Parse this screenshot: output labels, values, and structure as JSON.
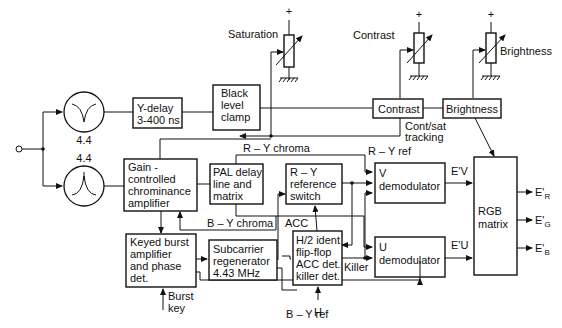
{
  "filters": {
    "notch": {
      "label": "4.4",
      "icon": "notch-filter-icon"
    },
    "bandpass": {
      "label": "4.4",
      "icon": "bandpass-filter-icon"
    }
  },
  "blocks": {
    "y_delay": [
      "Y-delay",
      "3-400 ns"
    ],
    "black_clamp": [
      "Black",
      "level",
      "clamp"
    ],
    "contrast": [
      "Contrast"
    ],
    "brightness": [
      "Brightness"
    ],
    "gain_amp": [
      "Gain -",
      "controlled",
      "chrominance",
      "amplifier"
    ],
    "pal_delay": [
      "PAL delay",
      "line and",
      "matrix"
    ],
    "ry_switch": [
      "R – Y",
      "reference",
      "switch"
    ],
    "v_demod": [
      "V",
      "demodulator"
    ],
    "u_demod": [
      "U",
      "demodulator"
    ],
    "rgb_matrix": [
      "RGB",
      "matrix"
    ],
    "keyed_burst": [
      "Keyed burst",
      "amplifier",
      "and phase",
      "det."
    ],
    "subcarrier": [
      "Subcarrier",
      "regenerator",
      "4.43 MHz"
    ],
    "h2_ident": [
      "H/2 ident",
      "flip-flop",
      "ACC det.",
      "killer det."
    ]
  },
  "controls": {
    "saturation": {
      "label": "Saturation",
      "supply": "+"
    },
    "contrast": {
      "label": "Contrast",
      "supply": "+"
    },
    "brightness": {
      "label": "Brightness",
      "supply": "+"
    }
  },
  "signals": {
    "cont_sat": [
      "Cont/sat",
      "tracking"
    ],
    "ry_chroma": "R – Y chroma",
    "ry_ref": "R – Y ref",
    "by_chroma": "B – Y chroma",
    "acc": "ACC",
    "by_ref": "B – Y ref",
    "h": "H",
    "killer": "Killer",
    "burst_key": [
      "Burst",
      "key"
    ],
    "ev": "E'V",
    "eu": "E'U",
    "er": {
      "main": "E'",
      "sub": "R"
    },
    "eg": {
      "main": "E'",
      "sub": "G"
    },
    "eb": {
      "main": "E'",
      "sub": "B"
    }
  }
}
